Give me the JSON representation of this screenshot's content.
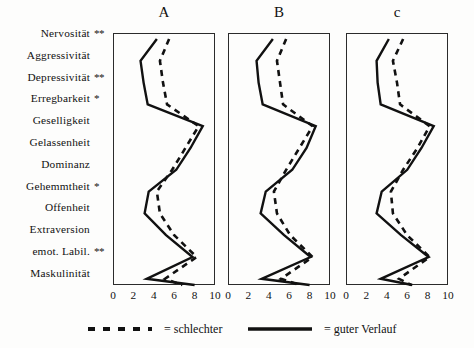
{
  "figure": {
    "y_categories": [
      {
        "label": "Nervosität",
        "significance": "**"
      },
      {
        "label": "Aggressivität",
        "significance": ""
      },
      {
        "label": "Depressivität",
        "significance": "**"
      },
      {
        "label": "Erregbarkeit",
        "significance": "*"
      },
      {
        "label": "Geselligkeit",
        "significance": ""
      },
      {
        "label": "Gelassenheit",
        "significance": ""
      },
      {
        "label": "Dominanz",
        "significance": ""
      },
      {
        "label": "Gehemmtheit",
        "significance": "*"
      },
      {
        "label": "Offenheit",
        "significance": ""
      },
      {
        "label": "Extraversion",
        "significance": ""
      },
      {
        "label": "emot. Labil.",
        "significance": "**"
      },
      {
        "label": "Maskulinität",
        "significance": ""
      }
    ],
    "x_ticks": [
      0,
      2,
      4,
      6,
      8,
      10
    ],
    "panel_titles": [
      "A",
      "B",
      "c"
    ],
    "legend": [
      {
        "style": "dashed",
        "label": "= schlechter"
      },
      {
        "style": "solid",
        "label": "= guter Verlauf"
      }
    ],
    "colors": {
      "line": "#111111",
      "frame": "#2b2b2b",
      "background": "#fdfdfc"
    }
  },
  "chart_data": {
    "type": "line",
    "title": "",
    "subtitle": "",
    "xlabel": "",
    "ylabel": "",
    "xlim": [
      0,
      10
    ],
    "grid": false,
    "legend_position": "bottom",
    "orientation": "horizontal-profile",
    "categories": [
      "Nervosität",
      "Aggressivität",
      "Depressivität",
      "Erregbarkeit",
      "Geselligkeit",
      "Gelassenheit",
      "Dominanz",
      "Gehemmtheit",
      "Offenheit",
      "Extraversion",
      "emot. Labil.",
      "Maskulinität"
    ],
    "panels": [
      {
        "name": "A",
        "series": [
          {
            "name": "guter Verlauf",
            "style": "solid",
            "values": [
              4.3,
              2.7,
              3.0,
              3.4,
              8.8,
              7.6,
              6.2,
              3.5,
              3.1,
              5.2,
              7.8,
              3.3,
              8.0
            ]
          },
          {
            "name": "schlechter",
            "style": "dashed",
            "values": [
              5.5,
              4.6,
              4.9,
              5.3,
              8.4,
              7.1,
              5.8,
              4.3,
              4.6,
              6.0,
              8.2,
              5.1,
              6.8
            ]
          }
        ]
      },
      {
        "name": "B",
        "series": [
          {
            "name": "guter Verlauf",
            "style": "solid",
            "values": [
              4.4,
              2.8,
              3.0,
              3.4,
              8.6,
              7.7,
              6.3,
              3.7,
              3.2,
              5.5,
              8.1,
              3.3,
              8.0
            ]
          },
          {
            "name": "schlechter",
            "style": "dashed",
            "values": [
              5.7,
              4.8,
              5.1,
              5.4,
              8.3,
              7.0,
              5.7,
              4.5,
              4.8,
              6.1,
              8.3,
              5.2,
              7.0
            ]
          }
        ]
      },
      {
        "name": "c",
        "series": [
          {
            "name": "guter Verlauf",
            "style": "solid",
            "values": [
              4.2,
              3.0,
              3.1,
              3.4,
              8.6,
              7.4,
              6.0,
              3.5,
              3.0,
              5.4,
              8.1,
              3.4,
              6.5
            ]
          },
          {
            "name": "schlechter",
            "style": "dashed",
            "values": [
              5.6,
              4.6,
              5.0,
              5.3,
              8.2,
              7.0,
              5.6,
              4.4,
              4.6,
              6.0,
              8.2,
              5.2,
              6.4
            ]
          }
        ]
      }
    ]
  },
  "layout": {
    "panel_left": [
      113,
      228,
      346
    ],
    "panel_width": 102,
    "panel_top": 33,
    "panel_height": 252,
    "row_step": 21.8,
    "row_offset": 6
  }
}
